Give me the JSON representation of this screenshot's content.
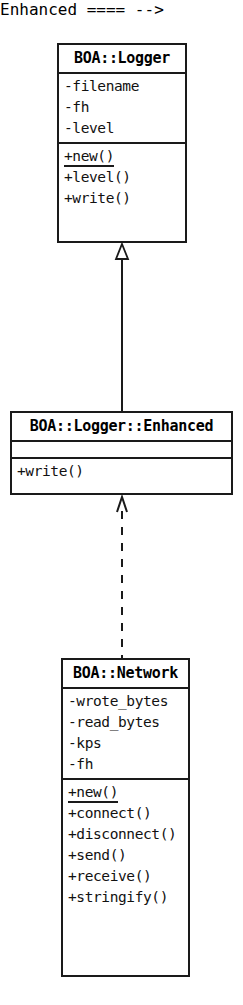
{
  "diagram": {
    "kind": "uml-class-diagram",
    "background_color": "#ffffff",
    "stroke_color": "#1a1a1a",
    "classes": [
      {
        "id": "boa-logger",
        "name": "BOA::Logger",
        "attributes": [
          {
            "text": "-filename",
            "visibility": "-",
            "static": false
          },
          {
            "text": "-fh",
            "visibility": "-",
            "static": false
          },
          {
            "text": "-level",
            "visibility": "-",
            "static": false
          }
        ],
        "methods": [
          {
            "text": "+new()",
            "visibility": "+",
            "static": true
          },
          {
            "text": "+level()",
            "visibility": "+",
            "static": false
          },
          {
            "text": "+write()",
            "visibility": "+",
            "static": false
          }
        ]
      },
      {
        "id": "boa-logger-enhanced",
        "name": "BOA::Logger::Enhanced",
        "attributes": [],
        "methods": [
          {
            "text": "+write()",
            "visibility": "+",
            "static": false
          }
        ]
      },
      {
        "id": "boa-network",
        "name": "BOA::Network",
        "attributes": [
          {
            "text": "-wrote_bytes",
            "visibility": "-",
            "static": false
          },
          {
            "text": "-read_bytes",
            "visibility": "-",
            "static": false
          },
          {
            "text": "-kps",
            "visibility": "-",
            "static": false
          },
          {
            "text": "-fh",
            "visibility": "-",
            "static": false
          }
        ],
        "methods": [
          {
            "text": "+new()",
            "visibility": "+",
            "static": true
          },
          {
            "text": "+connect()",
            "visibility": "+",
            "static": false
          },
          {
            "text": "+disconnect()",
            "visibility": "+",
            "static": false
          },
          {
            "text": "+send()",
            "visibility": "+",
            "static": false
          },
          {
            "text": "+receive()",
            "visibility": "+",
            "static": false
          },
          {
            "text": "+stringify()",
            "visibility": "+",
            "static": false
          }
        ]
      }
    ],
    "relationships": [
      {
        "id": "generalization-enhanced-to-logger",
        "type": "generalization",
        "line_style": "solid",
        "arrow_style": "hollow-triangle",
        "from": "BOA::Logger::Enhanced",
        "to": "BOA::Logger"
      },
      {
        "id": "dependency-network-to-enhanced",
        "type": "dependency",
        "line_style": "dashed",
        "arrow_style": "open-arrow",
        "from": "BOA::Network",
        "to": "BOA::Logger::Enhanced"
      }
    ]
  }
}
